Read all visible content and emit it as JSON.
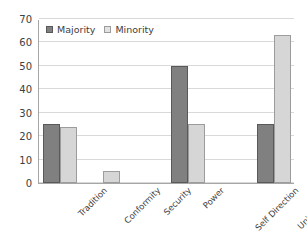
{
  "chart_data": {
    "type": "bar",
    "title": "",
    "subtitle": "",
    "xlabel": "",
    "ylabel": "",
    "ylim": [
      0,
      70
    ],
    "y_ticks": [
      0,
      10,
      20,
      30,
      40,
      50,
      60,
      70
    ],
    "grid": true,
    "legend_position": "top-left",
    "categories": [
      "Tradition",
      "Conformity",
      "Security",
      "Power",
      "Self Direction",
      "Universalism"
    ],
    "series": [
      {
        "name": "Majority",
        "color": "#808080",
        "values": [
          25,
          0,
          0,
          50,
          0,
          25
        ]
      },
      {
        "name": "Minority",
        "color": "#d6d6d6",
        "values": [
          24,
          5,
          0,
          25,
          0,
          63
        ]
      }
    ]
  },
  "legend": {
    "entries": [
      {
        "label": "Majority",
        "swatch": "majority-swatch-icon"
      },
      {
        "label": "Minority",
        "swatch": "minority-swatch-icon"
      }
    ]
  },
  "axes": {
    "y_tick_labels": [
      "70",
      "60",
      "50",
      "40",
      "30",
      "20",
      "10",
      "0"
    ],
    "x_tick_labels": [
      "Tradition",
      "Conformity",
      "Security",
      "Power",
      "Self Direction",
      "Universalism"
    ]
  },
  "colors": {
    "majority_fill": "#808080",
    "majority_border": "#595959",
    "minority_fill": "#d6d6d6",
    "minority_border": "#9c9c9c",
    "gridline": "#d9d9d9",
    "axis": "#a6a6a6",
    "text": "#404040",
    "background": "#ffffff"
  }
}
